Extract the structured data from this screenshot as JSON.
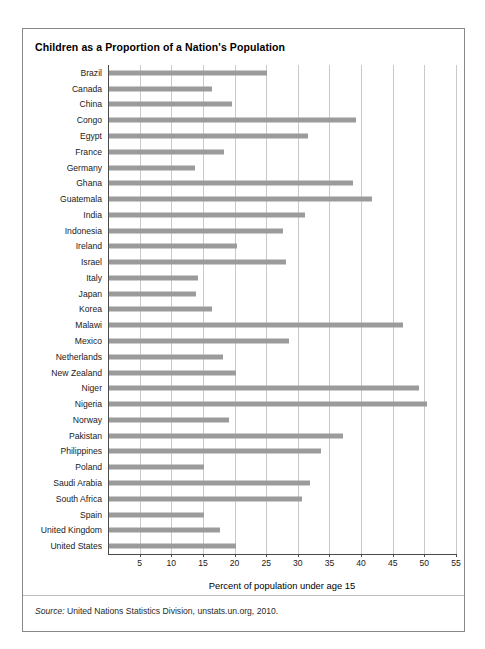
{
  "figure": {
    "title": "Children as a Proportion of a Nation's Population",
    "source_word": "Source:",
    "source_text": " United Nations Statistics Division, unstats.un.org, 2010.",
    "bar_color": "#9b9b9b",
    "grid_color": "#c9c9c9",
    "axis_color": "#4a4a4a",
    "frame_color": "#888888"
  },
  "chart_data": {
    "type": "bar",
    "orientation": "horizontal",
    "title": "Children as a Proportion of a Nation's Population",
    "subtitle": "",
    "xlabel": "Percent of population under age 15",
    "ylabel": "",
    "xlim": [
      0,
      55
    ],
    "ylim": null,
    "grid": true,
    "grid_axis": "x",
    "legend": false,
    "legend_position": "none",
    "xticks": [
      5,
      10,
      15,
      20,
      25,
      30,
      35,
      40,
      45,
      50,
      55
    ],
    "xtick_labels": [
      "5",
      "10",
      "15",
      "20",
      "25",
      "30",
      "35",
      "40",
      "45",
      "50",
      "55"
    ],
    "categories": [
      "Brazil",
      "Canada",
      "China",
      "Congo",
      "Egypt",
      "France",
      "Germany",
      "Ghana",
      "Guatemala",
      "India",
      "Indonesia",
      "Ireland",
      "Israel",
      "Italy",
      "Japan",
      "Korea",
      "Malawi",
      "Mexico",
      "Netherlands",
      "New Zealand",
      "Niger",
      "Nigeria",
      "Norway",
      "Pakistan",
      "Philippines",
      "Poland",
      "Saudi Arabia",
      "South Africa",
      "Spain",
      "United Kingdom",
      "United States"
    ],
    "values": [
      25.0,
      16.2,
      19.5,
      39.0,
      31.5,
      18.2,
      13.6,
      38.5,
      41.5,
      31.0,
      27.5,
      20.2,
      28.0,
      14.0,
      13.8,
      16.2,
      46.5,
      28.5,
      18.0,
      20.0,
      49.0,
      50.2,
      19.0,
      37.0,
      33.5,
      15.0,
      31.8,
      30.5,
      15.0,
      17.5,
      20.0
    ],
    "annotations": [
      "Source: United Nations Statistics Division, unstats.un.org, 2010."
    ]
  }
}
